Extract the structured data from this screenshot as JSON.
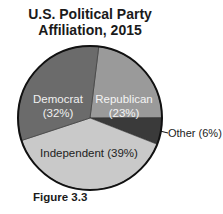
{
  "chart_data": {
    "type": "pie",
    "title": "U.S. Political Party Affiliation, 2015",
    "caption": "Figure 3.3",
    "categories": [
      "Republican",
      "Other",
      "Independent",
      "Democrat"
    ],
    "values": [
      23,
      6,
      39,
      32
    ],
    "unit": "%",
    "slices": [
      {
        "label": "Republican",
        "value": 23,
        "display": "Republican",
        "pct_label": "(23%)",
        "color": "#9a9a9a"
      },
      {
        "label": "Other",
        "value": 6,
        "display": "Other (6%)",
        "color": "#3a3a3a"
      },
      {
        "label": "Independent",
        "value": 39,
        "display": "Independent (39%)",
        "color": "#c9c9c9"
      },
      {
        "label": "Democrat",
        "value": 32,
        "display": "Democrat",
        "pct_label": "(32%)",
        "color": "#6b6b6b"
      }
    ],
    "start_angle_deg": 7,
    "legend": "none (direct labels)"
  },
  "title_line1": "U.S. Political Party",
  "title_line2": "Affiliation, 2015"
}
